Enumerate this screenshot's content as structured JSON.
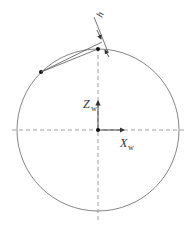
{
  "diagram": {
    "labels": {
      "z_axis": "Z",
      "z_sub": "w",
      "x_axis": "X",
      "x_sub": "w",
      "height": "h"
    },
    "colors": {
      "stroke": "#555555",
      "dashed": "#888888",
      "point": "#111111"
    }
  }
}
